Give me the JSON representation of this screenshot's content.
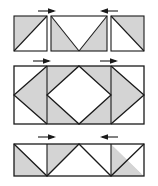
{
  "figure": {
    "title": "Triangle block tiling construction diagram",
    "background_color": "#ffffff",
    "fill_shaded": "#d4d4d4",
    "fill_plain": "#ffffff",
    "stroke_color": "#1a1a1a",
    "arrow_color": "#1a1a1a",
    "stroke_width": "1",
    "width": 158,
    "height": 186
  },
  "rows": [
    {
      "id": "row-top",
      "name": "top-row",
      "label": "Top row: three separated blocks",
      "y_top": 16,
      "y_bottom": 51,
      "blocks": [
        {
          "id": "block-top-left",
          "name": "square-block-shaded-upper-left",
          "x": 14,
          "width": 33,
          "pattern": "diagonal-bottom-left-to-top-right",
          "shaded_part": "upper-left"
        },
        {
          "id": "block-top-center",
          "name": "rect-block-v-notch",
          "x": 51,
          "width": 56,
          "pattern": "v-shape",
          "shaded_part": "left-and-right-triangles"
        },
        {
          "id": "block-top-right",
          "name": "square-block-shaded-upper-right",
          "x": 111,
          "width": 33,
          "pattern": "diagonal-top-left-to-bottom-right",
          "shaded_part": "upper-right"
        }
      ],
      "arrows": [
        {
          "id": "arrow-top-1",
          "name": "arrow-right",
          "direction": "right",
          "x": 38,
          "y": 11,
          "length": 18
        },
        {
          "id": "arrow-top-2",
          "name": "arrow-left",
          "direction": "left",
          "x": 99,
          "y": 11,
          "length": 18
        }
      ]
    },
    {
      "id": "row-middle",
      "name": "middle-row",
      "label": "Middle row: joined rectangle with central diamond",
      "y_top": 66,
      "y_bottom": 124,
      "x_left": 14,
      "x_right": 144,
      "dividers": [
        47,
        111
      ],
      "arrows": [
        {
          "id": "arrow-mid-1",
          "name": "arrow-right",
          "direction": "right",
          "x": 33,
          "y": 61,
          "length": 18
        },
        {
          "id": "arrow-mid-2",
          "name": "arrow-right",
          "direction": "right",
          "x": 100,
          "y": 61,
          "length": 18
        }
      ]
    },
    {
      "id": "row-bottom",
      "name": "bottom-row",
      "label": "Bottom row: joined rectangle with zigzag triangles",
      "y_top": 144,
      "y_bottom": 176,
      "x_left": 14,
      "x_right": 144,
      "dividers": [
        47,
        111
      ],
      "arrows": [
        {
          "id": "arrow-bot-1",
          "name": "arrow-right",
          "direction": "right",
          "x": 38,
          "y": 136,
          "length": 18
        },
        {
          "id": "arrow-bot-2",
          "name": "arrow-left",
          "direction": "left",
          "x": 99,
          "y": 136,
          "length": 18
        }
      ]
    }
  ]
}
